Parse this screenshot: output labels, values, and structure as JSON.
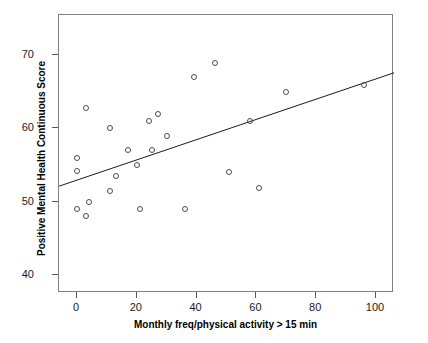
{
  "chart_data": {
    "type": "scatter",
    "title": "",
    "xlabel": "Monthly freq/physical activity > 15 min",
    "ylabel": "Positive Mental Health Continuous Score",
    "xlim": [
      -6,
      106
    ],
    "ylim": [
      37.5,
      75.5
    ],
    "xticks": [
      0,
      20,
      40,
      60,
      80,
      100
    ],
    "yticks": [
      40,
      50,
      60,
      70
    ],
    "xtick_labels": [
      "0",
      "20",
      "40",
      "60",
      "80",
      "100"
    ],
    "ytick_labels": [
      "40",
      "50",
      "60",
      "70"
    ],
    "grid": false,
    "legend": null,
    "marker": "open-circle",
    "marker_color": "#4d4d4d",
    "line_color": "#1a1a1a",
    "frame_color": "#808080",
    "points": [
      {
        "x": 0,
        "y": 56.0
      },
      {
        "x": 0,
        "y": 54.2
      },
      {
        "x": 0,
        "y": 49.0
      },
      {
        "x": 3,
        "y": 62.8
      },
      {
        "x": 3,
        "y": 48.0
      },
      {
        "x": 4,
        "y": 50.0
      },
      {
        "x": 11,
        "y": 60.0
      },
      {
        "x": 11,
        "y": 51.5
      },
      {
        "x": 13,
        "y": 53.5
      },
      {
        "x": 17,
        "y": 57.0
      },
      {
        "x": 20,
        "y": 55.0
      },
      {
        "x": 21,
        "y": 49.0
      },
      {
        "x": 24,
        "y": 61.0
      },
      {
        "x": 25,
        "y": 57.0
      },
      {
        "x": 27,
        "y": 62.0
      },
      {
        "x": 30,
        "y": 59.0
      },
      {
        "x": 36,
        "y": 49.0
      },
      {
        "x": 39,
        "y": 67.0
      },
      {
        "x": 46,
        "y": 69.0
      },
      {
        "x": 51,
        "y": 54.0
      },
      {
        "x": 58,
        "y": 61.0
      },
      {
        "x": 61,
        "y": 51.8
      },
      {
        "x": 70,
        "y": 65.0
      },
      {
        "x": 96,
        "y": 66.0
      }
    ],
    "fit_line": {
      "label": "linear fit",
      "x_start": -6,
      "y_start": 52.1,
      "x_end": 106,
      "y_end": 67.6
    }
  }
}
